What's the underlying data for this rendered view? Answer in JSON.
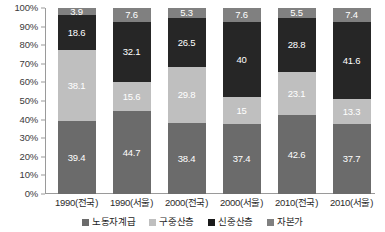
{
  "chart_data": {
    "type": "bar",
    "subtype": "stacked-percent-column",
    "title": "",
    "xlabel": "",
    "ylabel": "",
    "ylim": [
      0,
      100
    ],
    "ytick_labels": [
      "100%",
      "90%",
      "80%",
      "70%",
      "60%",
      "50%",
      "40%",
      "30%",
      "20%",
      "10%",
      "0%"
    ],
    "ytick_values": [
      100,
      90,
      80,
      70,
      60,
      50,
      40,
      30,
      20,
      10,
      0
    ],
    "grid": false,
    "legend_position": "bottom",
    "categories": [
      "1990(전국)",
      "1990(서울)",
      "2000(전국)",
      "2000(서울)",
      "2010(전국)",
      "2010(서울)"
    ],
    "series": [
      {
        "name": "노동자계급",
        "color": "#6b6b6b",
        "values": [
          39.4,
          44.7,
          38.4,
          37.4,
          42.6,
          37.7
        ],
        "labels": [
          "39.4",
          "44.7",
          "38.4",
          "37.4",
          "42.6",
          "37.7"
        ]
      },
      {
        "name": "구중산층",
        "color": "#bfbfbf",
        "values": [
          38.1,
          15.6,
          29.8,
          15,
          23.1,
          13.3
        ],
        "labels": [
          "38.1",
          "15.6",
          "29.8",
          "15",
          "23.1",
          "13.3"
        ]
      },
      {
        "name": "신중산층",
        "color": "#262626",
        "values": [
          18.6,
          32.1,
          26.5,
          40,
          28.8,
          41.6
        ],
        "labels": [
          "18.6",
          "32.1",
          "26.5",
          "40",
          "28.8",
          "41.6"
        ]
      },
      {
        "name": "자본가",
        "color": "#808080",
        "values": [
          3.9,
          7.6,
          5.3,
          7.6,
          5.5,
          7.4
        ],
        "labels": [
          "3.9",
          "7.6",
          "5.3",
          "7.6",
          "5.5",
          "7.4"
        ]
      }
    ],
    "stack_order_bottom_to_top": [
      "노동자계급",
      "구중산층",
      "신중산층",
      "자본가"
    ]
  },
  "legend": {
    "items": [
      {
        "label": "노동자계급",
        "color": "#6b6b6b"
      },
      {
        "label": "구중산층",
        "color": "#bfbfbf"
      },
      {
        "label": "신중산층",
        "color": "#1a1a1a"
      },
      {
        "label": "자본가",
        "color": "#808080"
      }
    ]
  },
  "axis": {
    "plot_background": "#ffffff",
    "axis_line_color": "#9a9a9a"
  }
}
